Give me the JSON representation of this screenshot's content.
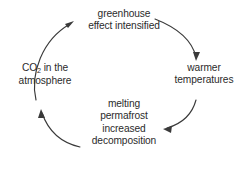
{
  "diagram": {
    "type": "cycle",
    "background_color": "#ffffff",
    "stroke_color": "#3a3a3a",
    "text_color": "#2b2b2b",
    "direction": "clockwise",
    "nodes": [
      {
        "id": "greenhouse",
        "position": "top",
        "lines": [
          "greenhouse",
          "effect intensified"
        ]
      },
      {
        "id": "warmer",
        "position": "right",
        "lines": [
          "warmer",
          "temperatures"
        ]
      },
      {
        "id": "permafrost",
        "position": "bottom",
        "lines": [
          "melting",
          "permafrost",
          "increased",
          "decomposition"
        ]
      },
      {
        "id": "co2",
        "position": "left",
        "lines_pre": [
          "CO",
          "",
          " in the"
        ],
        "subscript": "2",
        "line2": "atmosphere"
      }
    ],
    "arrows": [
      {
        "id": "arrow-co2-to-greenhouse",
        "from": "co2",
        "to": "greenhouse",
        "head": "up-right"
      },
      {
        "id": "arrow-greenhouse-to-warmer",
        "from": "greenhouse",
        "to": "warmer",
        "head": "down"
      },
      {
        "id": "arrow-warmer-to-permafrost",
        "from": "warmer",
        "to": "permafrost",
        "head": "left"
      },
      {
        "id": "arrow-permafrost-to-co2",
        "from": "permafrost",
        "to": "co2",
        "head": "up"
      }
    ]
  }
}
